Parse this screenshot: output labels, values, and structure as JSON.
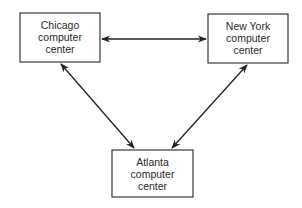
{
  "diagram": {
    "nodes": [
      {
        "id": "chicago",
        "lines": [
          "Chicago",
          "computer",
          "center"
        ]
      },
      {
        "id": "newyork",
        "lines": [
          "New York",
          "computer",
          "center"
        ]
      },
      {
        "id": "atlanta",
        "lines": [
          "Atlanta",
          "computer",
          "center"
        ]
      }
    ],
    "edges": [
      {
        "from": "chicago",
        "to": "newyork",
        "direction": "bidirectional"
      },
      {
        "from": "chicago",
        "to": "atlanta",
        "direction": "bidirectional"
      },
      {
        "from": "newyork",
        "to": "atlanta",
        "direction": "bidirectional"
      }
    ]
  }
}
